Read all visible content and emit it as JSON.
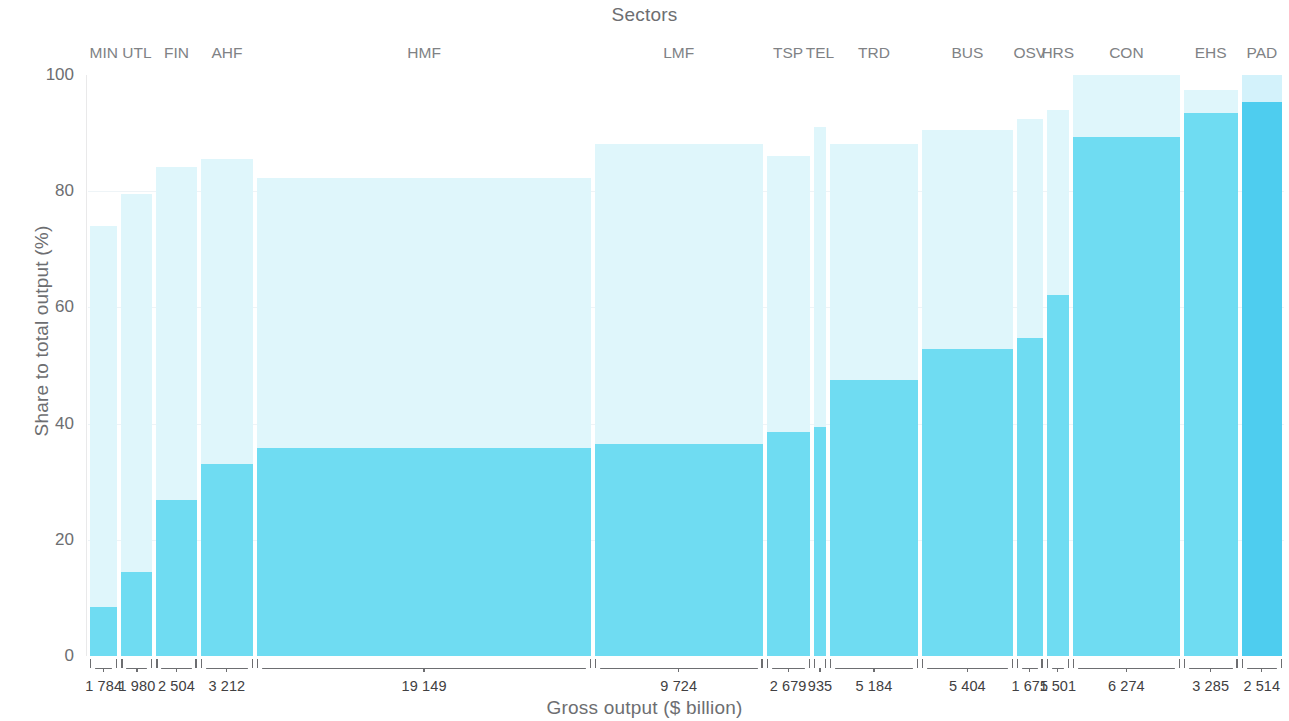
{
  "titles": {
    "top": "Sectors",
    "bottom": "Gross output ($ billion)",
    "yaxis": "Share to total output (%)"
  },
  "colors": {
    "light_segment": "#dff6fb",
    "dark_segment": "#6fdcf2",
    "pad_dark_segment": "#4ecdef",
    "text": "#6d6e71",
    "value_text": "#414042"
  },
  "yaxis": {
    "ticks": [
      "0",
      "20",
      "40",
      "60",
      "80",
      "100"
    ],
    "min": 0,
    "max": 100
  },
  "chart_data": {
    "type": "bar",
    "subtype": "marimekko",
    "title": "Sectors",
    "xlabel": "Gross output ($ billion)",
    "ylabel": "Share to total output (%)",
    "ylim": [
      0,
      100
    ],
    "grid": true,
    "legend": "none",
    "categories": [
      "MIN",
      "UTL",
      "FIN",
      "AHF",
      "HMF",
      "LMF",
      "TSP",
      "TEL",
      "TRD",
      "BUS",
      "OSV",
      "HRS",
      "CON",
      "EHS",
      "PAD"
    ],
    "width_label": "Gross output ($ billion)",
    "widths": [
      1784,
      1980,
      2504,
      3212,
      19149,
      9724,
      2679,
      935,
      5184,
      5404,
      1675,
      1501,
      6274,
      3285,
      2514
    ],
    "width_labels": [
      "1 784",
      "1 980",
      "2 504",
      "3 212",
      "19 149",
      "9 724",
      "2 679",
      "935",
      "5 184",
      "5 404",
      "1 675",
      "1 501",
      "6 274",
      "3 285",
      "2 514"
    ],
    "series": [
      {
        "name": "lower-share",
        "color": "#6fdcf2",
        "values": [
          8.5,
          14.5,
          26.8,
          33.0,
          35.8,
          36.5,
          38.5,
          39.5,
          47.5,
          52.8,
          54.8,
          62.2,
          89.3,
          93.5,
          95.3
        ]
      },
      {
        "name": "total-share",
        "color": "#dff6fb",
        "values": [
          74.0,
          79.5,
          84.2,
          85.5,
          82.3,
          88.2,
          86.0,
          91.0,
          88.2,
          90.5,
          92.5,
          94.0,
          100.0,
          97.5,
          100.0
        ]
      }
    ]
  }
}
